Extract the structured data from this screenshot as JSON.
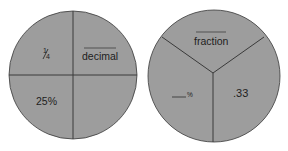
{
  "colors": {
    "circle_fill": "#9d9d9d",
    "circle_stroke": "#3a3a3a",
    "divider": "#3a3a3a",
    "text": "#1e1e1e",
    "background": "#ffffff"
  },
  "left_circle": {
    "description": "Circle divided into four quarters",
    "sections": {
      "top_left": {
        "numerator": "1",
        "denominator": "4"
      },
      "top_right": {
        "label": "decimal",
        "blank_line": true
      },
      "bottom_left": {
        "label": "25%"
      },
      "bottom_right": {
        "label": ""
      }
    }
  },
  "right_circle": {
    "description": "Circle divided into three thirds",
    "sections": {
      "top": {
        "label": "fraction",
        "blank_line": true
      },
      "bottom_left": {
        "blank": "___",
        "suffix": "%"
      },
      "bottom_right": {
        "label": ".33"
      }
    }
  }
}
